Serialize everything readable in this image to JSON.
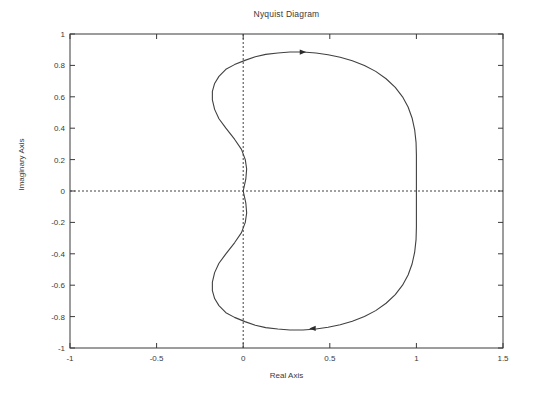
{
  "figure": {
    "background_color": "#ffffff",
    "line_color": "#404040",
    "axis_color": "#3a3a3a"
  },
  "chart_data": {
    "type": "line",
    "title": "Nyquist Diagram",
    "xlabel": "Real Axis",
    "ylabel": "Imaginary Axis",
    "xlim": [
      -1,
      1.5
    ],
    "ylim": [
      -1,
      1
    ],
    "xticks": [
      -1,
      -0.5,
      0,
      0.5,
      1,
      1.5
    ],
    "xtick_labels": [
      "-1",
      "-0.5",
      "0",
      "0.5",
      "1",
      "1.5"
    ],
    "yticks": [
      1,
      0.8,
      0.6,
      0.4,
      0.2,
      0,
      -0.2,
      -0.4,
      -0.6,
      -0.8,
      -1
    ],
    "ytick_labels": [
      "1",
      "0.8",
      "0.6",
      "0.4",
      "0.2",
      "0",
      "-0.2",
      "-0.4",
      "-0.6",
      "-0.8",
      "-1"
    ],
    "grid": false,
    "legend": null,
    "zero_lines": {
      "x": 0,
      "y": 0,
      "style": "dotted"
    },
    "annotations": [
      {
        "name": "direction-arrow-upper",
        "x": 0.345,
        "y": 0.885,
        "direction": "right"
      },
      {
        "name": "direction-arrow-lower",
        "x": 0.4,
        "y": -0.875,
        "direction": "left"
      }
    ],
    "series": [
      {
        "name": "nyquist-contour",
        "color": "#404040",
        "closed": true,
        "points": [
          [
            0.0,
            0.0
          ],
          [
            0.015,
            0.075
          ],
          [
            0.02,
            0.14
          ],
          [
            0.012,
            0.2
          ],
          [
            -0.01,
            0.265
          ],
          [
            -0.05,
            0.33
          ],
          [
            -0.1,
            0.4
          ],
          [
            -0.14,
            0.46
          ],
          [
            -0.165,
            0.52
          ],
          [
            -0.178,
            0.58
          ],
          [
            -0.178,
            0.635
          ],
          [
            -0.165,
            0.685
          ],
          [
            -0.14,
            0.73
          ],
          [
            -0.1,
            0.775
          ],
          [
            -0.05,
            0.805
          ],
          [
            0.01,
            0.832
          ],
          [
            0.07,
            0.855
          ],
          [
            0.13,
            0.87
          ],
          [
            0.2,
            0.879
          ],
          [
            0.27,
            0.885
          ],
          [
            0.345,
            0.885
          ],
          [
            0.42,
            0.879
          ],
          [
            0.49,
            0.868
          ],
          [
            0.56,
            0.852
          ],
          [
            0.63,
            0.83
          ],
          [
            0.7,
            0.8
          ],
          [
            0.765,
            0.762
          ],
          [
            0.825,
            0.715
          ],
          [
            0.878,
            0.66
          ],
          [
            0.92,
            0.6
          ],
          [
            0.952,
            0.535
          ],
          [
            0.975,
            0.465
          ],
          [
            0.99,
            0.39
          ],
          [
            0.998,
            0.31
          ],
          [
            1.0,
            0.23
          ],
          [
            1.0,
            0.15
          ],
          [
            1.0,
            0.07
          ],
          [
            1.0,
            0.0
          ],
          [
            1.0,
            -0.07
          ],
          [
            1.0,
            -0.15
          ],
          [
            1.0,
            -0.23
          ],
          [
            0.998,
            -0.31
          ],
          [
            0.99,
            -0.39
          ],
          [
            0.975,
            -0.465
          ],
          [
            0.952,
            -0.535
          ],
          [
            0.92,
            -0.6
          ],
          [
            0.878,
            -0.66
          ],
          [
            0.825,
            -0.715
          ],
          [
            0.765,
            -0.762
          ],
          [
            0.7,
            -0.8
          ],
          [
            0.63,
            -0.83
          ],
          [
            0.56,
            -0.852
          ],
          [
            0.49,
            -0.868
          ],
          [
            0.42,
            -0.879
          ],
          [
            0.345,
            -0.885
          ],
          [
            0.27,
            -0.885
          ],
          [
            0.2,
            -0.879
          ],
          [
            0.13,
            -0.87
          ],
          [
            0.07,
            -0.855
          ],
          [
            0.01,
            -0.832
          ],
          [
            -0.05,
            -0.805
          ],
          [
            -0.1,
            -0.775
          ],
          [
            -0.14,
            -0.73
          ],
          [
            -0.165,
            -0.685
          ],
          [
            -0.178,
            -0.635
          ],
          [
            -0.178,
            -0.58
          ],
          [
            -0.165,
            -0.52
          ],
          [
            -0.14,
            -0.46
          ],
          [
            -0.1,
            -0.4
          ],
          [
            -0.05,
            -0.33
          ],
          [
            -0.01,
            -0.265
          ],
          [
            0.012,
            -0.2
          ],
          [
            0.02,
            -0.14
          ],
          [
            0.015,
            -0.075
          ],
          [
            0.0,
            0.0
          ]
        ]
      }
    ]
  }
}
